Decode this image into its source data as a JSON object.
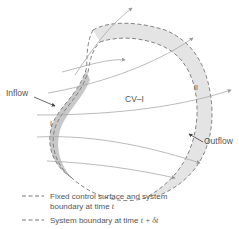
{
  "labels": {
    "inflow": "Inflow",
    "outflow": "Outflow",
    "cv": "CV–I",
    "region_one": "I",
    "region_two": "II"
  },
  "legend": [
    {
      "text": "Fixed control surface and system",
      "text2": "boundary at time ",
      "var": "t"
    },
    {
      "text": "System boundary at time ",
      "var": "t + δt"
    }
  ],
  "colors": {
    "line": "#8a8a8a",
    "streamline": "#a0a0a0",
    "shade_light": "#e4e4e4",
    "shade_dark": "#c8c8c8",
    "text": "#555555"
  }
}
